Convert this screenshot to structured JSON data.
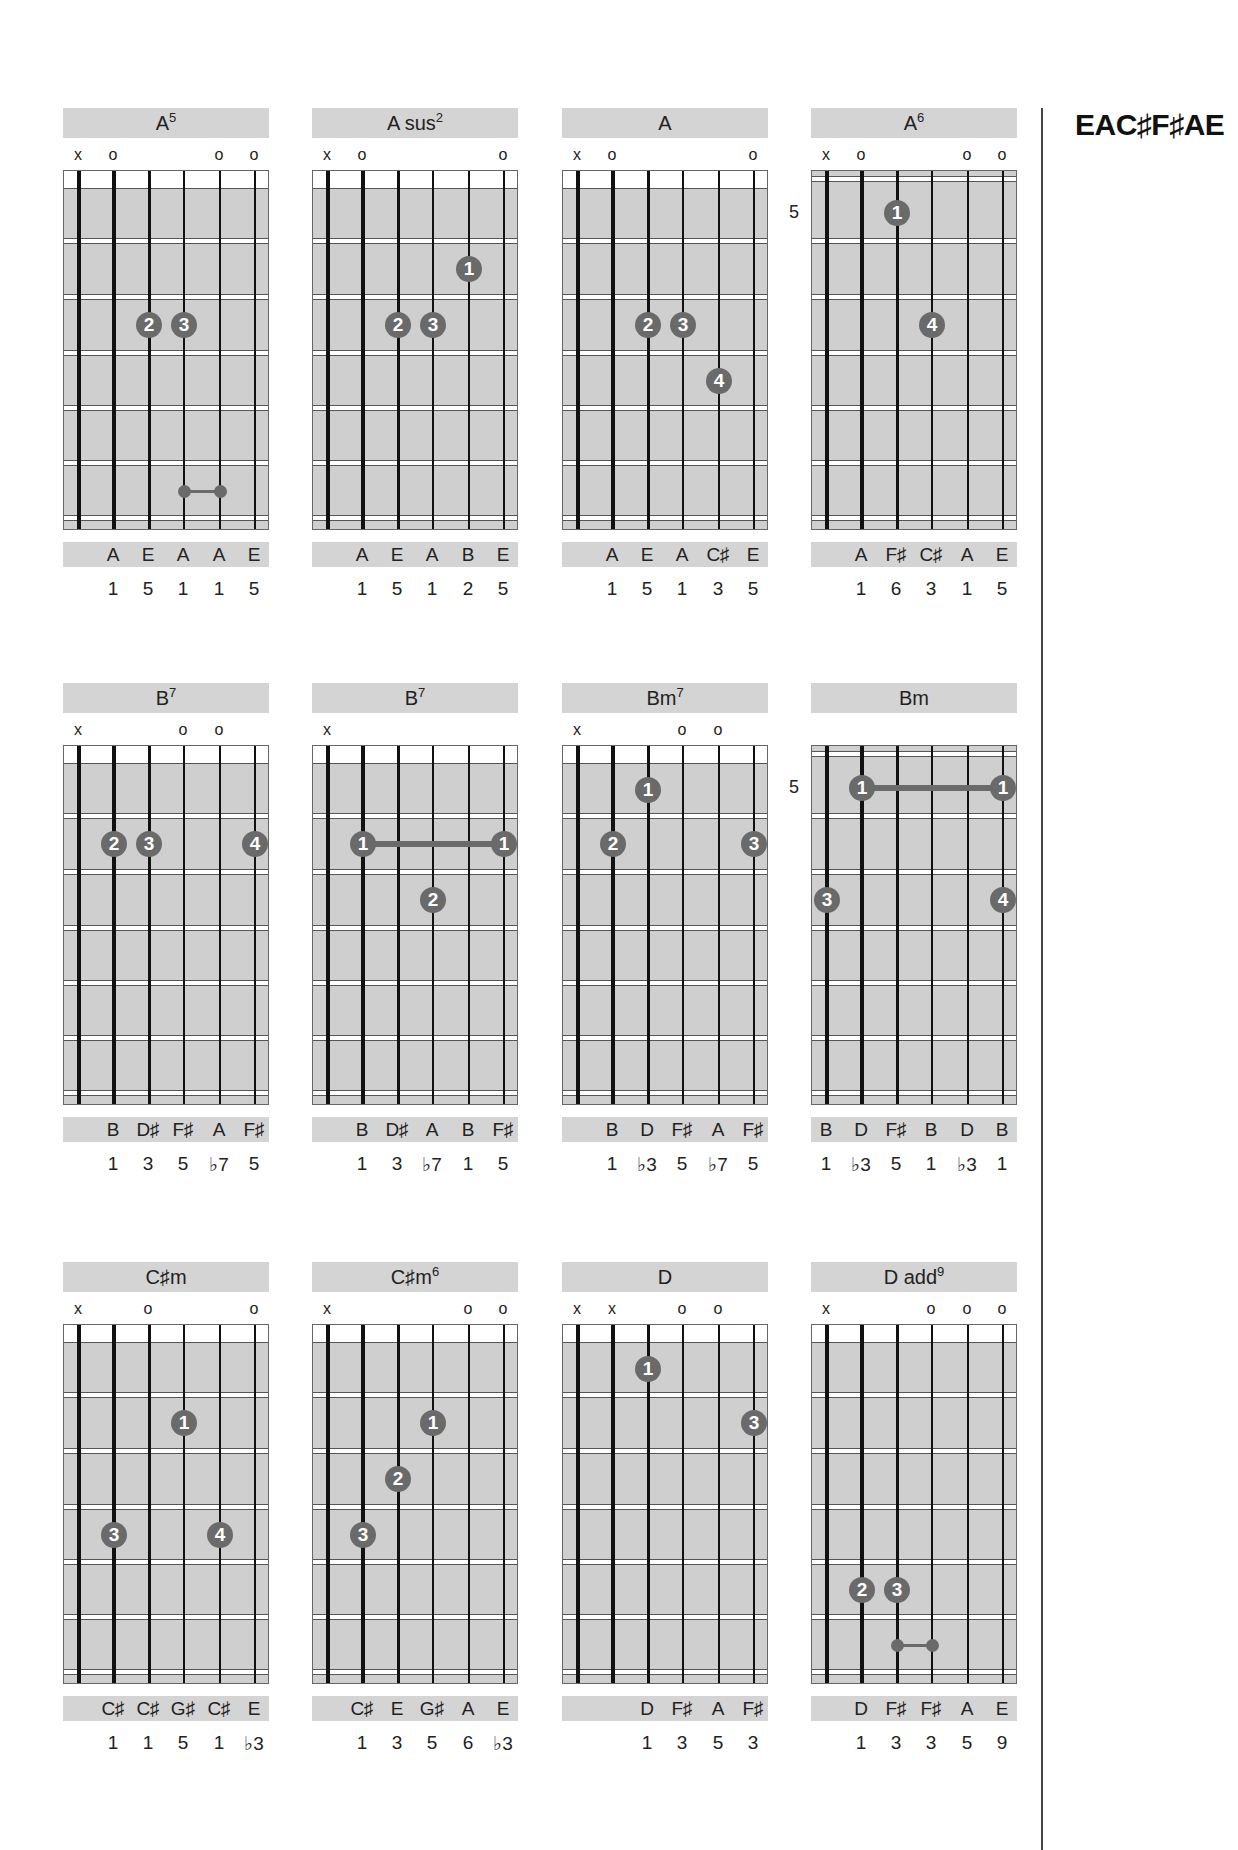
{
  "tuning": "EAC♯F♯AE",
  "chords": [
    {
      "name": "A",
      "sup": "5",
      "col": 0,
      "row": 0,
      "position": null,
      "markers": [
        "x",
        "o",
        "",
        "",
        "o",
        "o"
      ],
      "fingers": [
        {
          "n": "2",
          "s": 3,
          "f": 2
        },
        {
          "n": "3",
          "s": 4,
          "f": 2
        }
      ],
      "barres": [],
      "small_barres": [
        {
          "s1": 4,
          "s2": 5,
          "f": 5
        }
      ],
      "notes": [
        "",
        "A",
        "E",
        "A",
        "A",
        "E"
      ],
      "intervals": [
        "",
        "1",
        "5",
        "1",
        "1",
        "5"
      ]
    },
    {
      "name": "A sus",
      "sup": "2",
      "col": 1,
      "row": 0,
      "position": null,
      "markers": [
        "x",
        "o",
        "",
        "",
        "",
        "o"
      ],
      "fingers": [
        {
          "n": "1",
          "s": 5,
          "f": 1
        },
        {
          "n": "2",
          "s": 3,
          "f": 2
        },
        {
          "n": "3",
          "s": 4,
          "f": 2
        }
      ],
      "barres": [],
      "small_barres": [],
      "notes": [
        "",
        "A",
        "E",
        "A",
        "B",
        "E"
      ],
      "intervals": [
        "",
        "1",
        "5",
        "1",
        "2",
        "5"
      ]
    },
    {
      "name": "A",
      "sup": "",
      "col": 2,
      "row": 0,
      "position": null,
      "markers": [
        "x",
        "o",
        "",
        "",
        "",
        "o"
      ],
      "fingers": [
        {
          "n": "2",
          "s": 3,
          "f": 2
        },
        {
          "n": "3",
          "s": 4,
          "f": 2
        },
        {
          "n": "4",
          "s": 5,
          "f": 3
        }
      ],
      "barres": [],
      "small_barres": [],
      "notes": [
        "",
        "A",
        "E",
        "A",
        "C♯",
        "E"
      ],
      "intervals": [
        "",
        "1",
        "5",
        "1",
        "3",
        "5"
      ]
    },
    {
      "name": "A",
      "sup": "6",
      "col": 3,
      "row": 0,
      "position": "5",
      "markers": [
        "x",
        "o",
        "",
        "",
        "o",
        "o"
      ],
      "fingers": [
        {
          "n": "1",
          "s": 3,
          "f": 0
        },
        {
          "n": "4",
          "s": 4,
          "f": 2
        }
      ],
      "barres": [],
      "small_barres": [],
      "notes": [
        "",
        "A",
        "F♯",
        "C♯",
        "A",
        "E"
      ],
      "intervals": [
        "",
        "1",
        "6",
        "3",
        "1",
        "5"
      ]
    },
    {
      "name": "B",
      "sup": "7",
      "col": 0,
      "row": 1,
      "position": null,
      "markers": [
        "x",
        "",
        "",
        "o",
        "o",
        ""
      ],
      "fingers": [
        {
          "n": "2",
          "s": 2,
          "f": 1
        },
        {
          "n": "3",
          "s": 3,
          "f": 1
        },
        {
          "n": "4",
          "s": 6,
          "f": 1
        }
      ],
      "barres": [],
      "small_barres": [],
      "notes": [
        "",
        "B",
        "D♯",
        "F♯",
        "A",
        "F♯"
      ],
      "intervals": [
        "",
        "1",
        "3",
        "5",
        "♭7",
        "5"
      ]
    },
    {
      "name": "B",
      "sup": "7",
      "col": 1,
      "row": 1,
      "position": null,
      "markers": [
        "x",
        "",
        "",
        "",
        "",
        ""
      ],
      "fingers": [
        {
          "n": "1",
          "s": 2,
          "f": 1
        },
        {
          "n": "1",
          "s": 6,
          "f": 1
        },
        {
          "n": "2",
          "s": 4,
          "f": 2
        }
      ],
      "barres": [
        {
          "s1": 2,
          "s2": 6,
          "f": 1
        }
      ],
      "small_barres": [],
      "notes": [
        "",
        "B",
        "D♯",
        "A",
        "B",
        "F♯"
      ],
      "intervals": [
        "",
        "1",
        "3",
        "♭7",
        "1",
        "5"
      ]
    },
    {
      "name": "Bm",
      "sup": "7",
      "col": 2,
      "row": 1,
      "position": null,
      "markers": [
        "x",
        "",
        "",
        "o",
        "o",
        ""
      ],
      "fingers": [
        {
          "n": "1",
          "s": 3,
          "f": 0
        },
        {
          "n": "2",
          "s": 2,
          "f": 1
        },
        {
          "n": "3",
          "s": 6,
          "f": 1
        }
      ],
      "barres": [],
      "small_barres": [],
      "notes": [
        "",
        "B",
        "D",
        "F♯",
        "A",
        "F♯"
      ],
      "intervals": [
        "",
        "1",
        "♭3",
        "5",
        "♭7",
        "5"
      ]
    },
    {
      "name": "Bm",
      "sup": "",
      "col": 3,
      "row": 1,
      "position": "5",
      "markers": [
        "",
        "",
        "",
        "",
        "",
        ""
      ],
      "fingers": [
        {
          "n": "1",
          "s": 2,
          "f": 0
        },
        {
          "n": "1",
          "s": 6,
          "f": 0
        },
        {
          "n": "3",
          "s": 1,
          "f": 2
        },
        {
          "n": "4",
          "s": 6,
          "f": 2
        }
      ],
      "barres": [
        {
          "s1": 2,
          "s2": 6,
          "f": 0
        }
      ],
      "small_barres": [],
      "notes": [
        "B",
        "D",
        "F♯",
        "B",
        "D",
        "B"
      ],
      "intervals": [
        "1",
        "♭3",
        "5",
        "1",
        "♭3",
        "1"
      ]
    },
    {
      "name": "C♯m",
      "sup": "",
      "col": 0,
      "row": 2,
      "position": null,
      "markers": [
        "x",
        "",
        "o",
        "",
        "",
        "o"
      ],
      "fingers": [
        {
          "n": "1",
          "s": 4,
          "f": 1
        },
        {
          "n": "3",
          "s": 2,
          "f": 3
        },
        {
          "n": "4",
          "s": 5,
          "f": 3
        }
      ],
      "barres": [],
      "small_barres": [],
      "notes": [
        "",
        "C♯",
        "C♯",
        "G♯",
        "C♯",
        "E"
      ],
      "intervals": [
        "",
        "1",
        "1",
        "5",
        "1",
        "♭3"
      ]
    },
    {
      "name": "C♯m",
      "sup": "6",
      "col": 1,
      "row": 2,
      "position": null,
      "markers": [
        "x",
        "",
        "",
        "",
        "o",
        "o"
      ],
      "fingers": [
        {
          "n": "1",
          "s": 4,
          "f": 1
        },
        {
          "n": "2",
          "s": 3,
          "f": 2
        },
        {
          "n": "3",
          "s": 2,
          "f": 3
        }
      ],
      "barres": [],
      "small_barres": [],
      "notes": [
        "",
        "C♯",
        "E",
        "G♯",
        "A",
        "E"
      ],
      "intervals": [
        "",
        "1",
        "3",
        "5",
        "6",
        "♭3"
      ]
    },
    {
      "name": "D",
      "sup": "",
      "col": 2,
      "row": 2,
      "position": null,
      "markers": [
        "x",
        "x",
        "",
        "o",
        "o",
        ""
      ],
      "fingers": [
        {
          "n": "1",
          "s": 3,
          "f": 0
        },
        {
          "n": "3",
          "s": 6,
          "f": 1
        }
      ],
      "barres": [],
      "small_barres": [],
      "notes": [
        "",
        "",
        "D",
        "F♯",
        "A",
        "F♯"
      ],
      "intervals": [
        "",
        "",
        "1",
        "3",
        "5",
        "3"
      ]
    },
    {
      "name": "D add",
      "sup": "9",
      "col": 3,
      "row": 2,
      "position": null,
      "markers": [
        "x",
        "",
        "",
        "o",
        "o",
        "o"
      ],
      "fingers": [
        {
          "n": "2",
          "s": 2,
          "f": 4
        },
        {
          "n": "3",
          "s": 3,
          "f": 4
        }
      ],
      "barres": [],
      "small_barres": [
        {
          "s1": 3,
          "s2": 4,
          "f": 5
        }
      ],
      "notes": [
        "",
        "D",
        "F♯",
        "F♯",
        "A",
        "E"
      ],
      "intervals": [
        "",
        "1",
        "3",
        "3",
        "5",
        "9"
      ]
    }
  ]
}
